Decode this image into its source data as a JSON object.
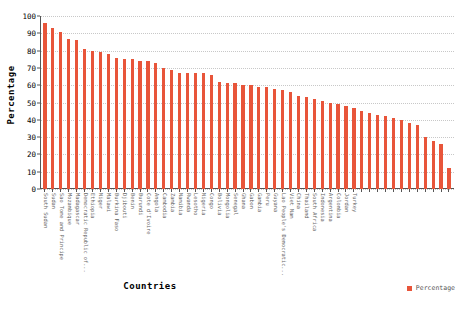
{
  "chart_data": {
    "type": "bar",
    "title": "",
    "xlabel": "Countries",
    "ylabel": "Percentage",
    "ylim": [
      0,
      100
    ],
    "yticks": [
      0,
      10,
      20,
      30,
      40,
      50,
      60,
      70,
      80,
      90,
      100
    ],
    "grid": true,
    "legend": {
      "position": "bottom-right",
      "entries": [
        {
          "label": "Percentage",
          "color": "#e8553a"
        }
      ]
    },
    "series_color": "#e8553a",
    "categories": [
      "South Sudan",
      "Sudan",
      "Sao Tome and Principe",
      "Mozambique",
      "Madagascar",
      "Democratic Republic of...",
      "Ethiopia",
      "Niger",
      "Malawi",
      "Burkina Faso",
      "Djibouti",
      "Benin",
      "Burundi",
      "Cote d'Ivoire",
      "Angola",
      "Cambodia",
      "Zambia",
      "Namibia",
      "Rwanda",
      "Lesotho",
      "Nigeria",
      "Congo",
      "Bolivia",
      "Mongolia",
      "Senegal",
      "Ghana",
      "Gabon",
      "Gambia",
      "Peru",
      "Guyana",
      "Lao People's Democratic...",
      "Viet Nam",
      "China",
      "Thailand",
      "South Africa",
      "Indonesia",
      "Argentina",
      "Colombia",
      "Jordan",
      "Turkey"
    ],
    "values": [
      96,
      93,
      91,
      87,
      86,
      81,
      80,
      79,
      78,
      76,
      75,
      75,
      74,
      74,
      73,
      70,
      69,
      67,
      67,
      67,
      67,
      66,
      62,
      61,
      61,
      60,
      60,
      59,
      59,
      58,
      57,
      56,
      54,
      53,
      52,
      51,
      50,
      49,
      48,
      47
    ],
    "bar_count": 52,
    "all_values": [
      96,
      93,
      91,
      87,
      86,
      81,
      80,
      79,
      78,
      76,
      75,
      75,
      74,
      74,
      73,
      70,
      69,
      67,
      67,
      67,
      67,
      66,
      62,
      61,
      61,
      60,
      60,
      59,
      59,
      58,
      57,
      56,
      54,
      53,
      52,
      51,
      50,
      49,
      48,
      47,
      45,
      44,
      43,
      42,
      41,
      40,
      38,
      37,
      30,
      28,
      26,
      12
    ]
  }
}
